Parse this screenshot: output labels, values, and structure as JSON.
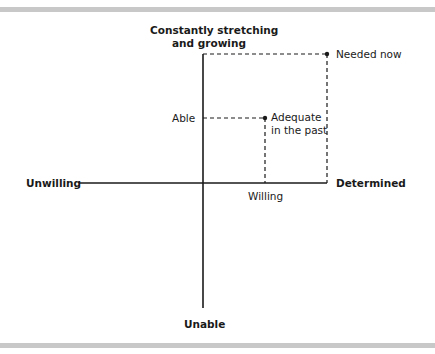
{
  "diagram": {
    "axes": {
      "top": "Constantly stretching\nand growing",
      "top_line1": "Constantly stretching",
      "top_line2": "and growing",
      "bottom": "Unable",
      "left": "Unwilling",
      "right": "Determined"
    },
    "points": [
      {
        "label_line1": "Needed now",
        "label_line2": "",
        "x_label": "",
        "y_label": ""
      },
      {
        "label_line1": "Adequate",
        "label_line2": "in the past",
        "x_label": "Willing",
        "y_label": "Able"
      }
    ],
    "colors": {
      "line": "#1a1a1a",
      "bar": "#c8c8c8",
      "background": "#ffffff"
    }
  }
}
